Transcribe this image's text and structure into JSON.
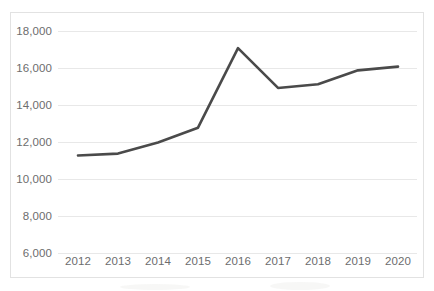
{
  "chart_data": {
    "type": "line",
    "title": "",
    "subtitle": "",
    "xlabel": "",
    "ylabel": "",
    "x": [
      "2012",
      "2013",
      "2014",
      "2015",
      "2016",
      "2017",
      "2018",
      "2019",
      "2020"
    ],
    "categories": [
      "2012",
      "2013",
      "2014",
      "2015",
      "2016",
      "2017",
      "2018",
      "2019",
      "2020"
    ],
    "values": [
      11300,
      11400,
      12000,
      12800,
      17100,
      14950,
      15150,
      15900,
      16100
    ],
    "series": [
      {
        "name": "",
        "values": [
          11300,
          11400,
          12000,
          12800,
          17100,
          14950,
          15150,
          15900,
          16100
        ]
      }
    ],
    "ylim": [
      6000,
      18000
    ],
    "ytick_labels": [
      "18,000",
      "16,000",
      "14,000",
      "12,000",
      "10,000",
      "8,000",
      "6,000"
    ],
    "ytick_values": [
      18000,
      16000,
      14000,
      12000,
      10000,
      8000,
      6000
    ],
    "xtick_labels": [
      "2012",
      "2013",
      "2014",
      "2015",
      "2016",
      "2017",
      "2018",
      "2019",
      "2020"
    ],
    "grid": true,
    "grid_axis": "y",
    "legend": false,
    "legend_position": "none",
    "markers": false,
    "line_color": "#4a4a4a",
    "grid_color": "#e8e8e8",
    "border_color": "#e2e2e2",
    "tick_label_color": "#6d6d6d",
    "background_color": "#ffffff",
    "line_width": 2.6
  },
  "axes": {
    "y_axis_name": "y-axis",
    "x_axis_name": "x-axis"
  }
}
